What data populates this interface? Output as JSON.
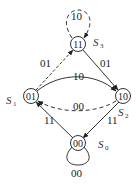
{
  "diagram": {
    "type": "state-transition",
    "states": [
      {
        "id": "S0",
        "name": "S",
        "sub": "0",
        "code": "00"
      },
      {
        "id": "S1",
        "name": "S",
        "sub": "1",
        "code": "01"
      },
      {
        "id": "S2",
        "name": "S",
        "sub": "2",
        "code": "10"
      },
      {
        "id": "S3",
        "name": "S",
        "sub": "3",
        "code": "11"
      }
    ],
    "transitions": [
      {
        "from": "S3",
        "to": "S3",
        "label": "10",
        "style": "dashed"
      },
      {
        "from": "S1",
        "to": "S3",
        "label": "01",
        "style": "dashed"
      },
      {
        "from": "S3",
        "to": "S2",
        "label": "01",
        "style": "solid"
      },
      {
        "from": "S1",
        "to": "S2",
        "label": "10",
        "style": "solid"
      },
      {
        "from": "S2",
        "to": "S1",
        "label": "00",
        "style": "dashed"
      },
      {
        "from": "S2",
        "to": "S0",
        "label": "11",
        "style": "solid"
      },
      {
        "from": "S0",
        "to": "S1",
        "label": "11",
        "style": "solid"
      },
      {
        "from": "S0",
        "to": "S0",
        "label": "00",
        "style": "solid"
      }
    ]
  }
}
